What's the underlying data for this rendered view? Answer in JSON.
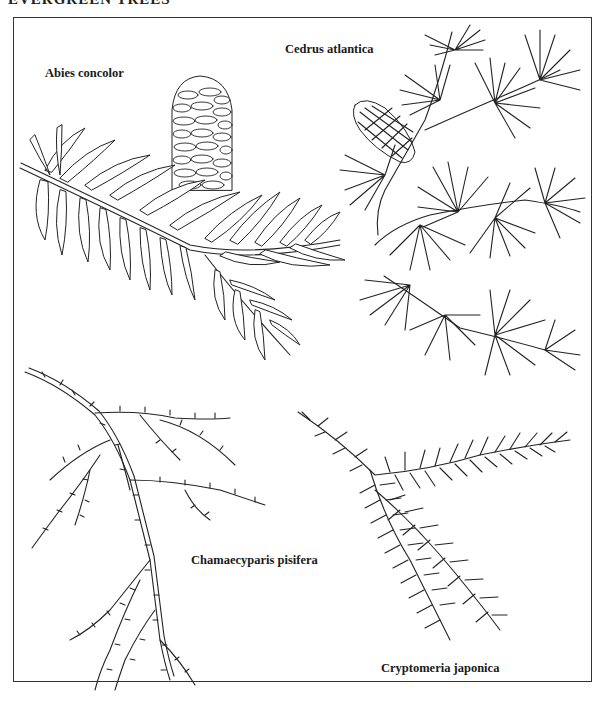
{
  "page": {
    "title": "EVERGREEN TREES",
    "background": "#ffffff",
    "ink_color": "#222222"
  },
  "plate": {
    "frame": {
      "left": 13,
      "top": 17,
      "right": 592,
      "bottom": 682
    },
    "specimens": [
      {
        "id": "abies",
        "label": "Abies concolor",
        "label_pos": {
          "x": 45,
          "y": 64
        },
        "features": [
          "cone",
          "flat-needled branch"
        ]
      },
      {
        "id": "cedrus",
        "label": "Cedrus atlantica",
        "label_pos": {
          "x": 285,
          "y": 40
        },
        "features": [
          "cone",
          "needle clusters"
        ]
      },
      {
        "id": "chamaecyparis",
        "label": "Chamaecyparis pisifera",
        "label_pos": {
          "x": 191,
          "y": 553
        },
        "features": [
          "scale-leaf branchlets"
        ]
      },
      {
        "id": "cryptomeria",
        "label": "Cryptomeria japonica",
        "label_pos": {
          "x": 380,
          "y": 660
        },
        "features": [
          "awl-shaped needles"
        ]
      }
    ]
  }
}
